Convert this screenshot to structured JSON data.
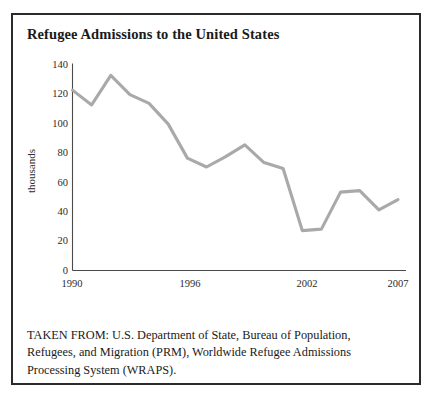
{
  "figure": {
    "title": "Refugee Admissions to the United States",
    "source_lines": [
      "TAKEN FROM: U.S. Department of State, Bureau of Population,",
      "Refugees, and Migration (PRM), Worldwide Refugee Admissions",
      "Processing System (WRAPS)."
    ]
  },
  "chart_data": {
    "type": "line",
    "title": "Refugee Admissions to the United States",
    "xlabel": "",
    "ylabel": "thousands",
    "x": [
      1990,
      1991,
      1992,
      1993,
      1994,
      1995,
      1996,
      1997,
      1998,
      1999,
      2000,
      2001,
      2002,
      2003,
      2004,
      2005,
      2006,
      2007
    ],
    "values": [
      122,
      112,
      132,
      119,
      113,
      99,
      76,
      70,
      77,
      85,
      73,
      69,
      27,
      28,
      53,
      54,
      41,
      48
    ],
    "series": [
      {
        "name": "Refugee admissions",
        "values": [
          122,
          112,
          132,
          119,
          113,
          99,
          76,
          70,
          77,
          85,
          73,
          69,
          27,
          28,
          53,
          54,
          41,
          48
        ]
      }
    ],
    "xlim": [
      1990,
      2007
    ],
    "ylim": [
      0,
      140
    ],
    "yticks": [
      0,
      20,
      40,
      60,
      80,
      100,
      120,
      140
    ],
    "ytick_labels": [
      "0",
      "20",
      "40",
      "60",
      "80",
      "100",
      "120",
      "140"
    ],
    "xticks": [
      1990,
      1996,
      2002,
      2007
    ],
    "xtick_labels": [
      "1990",
      "1996",
      "2002",
      "2007"
    ],
    "grid": false,
    "legend": "none",
    "line_color": "#a9a9a9",
    "axis_color": "#4a4a4a",
    "units": "thousands"
  },
  "style": {
    "border_color": "#2b2b2b",
    "text_color": "#1a1a1a",
    "background": "#ffffff"
  }
}
